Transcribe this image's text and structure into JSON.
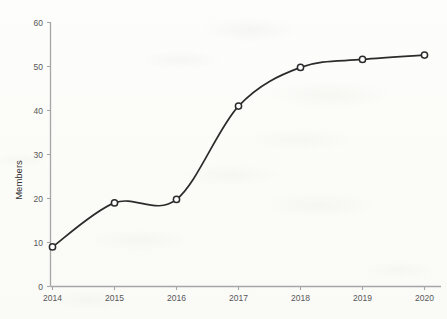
{
  "chart_data": {
    "type": "line",
    "title": "",
    "xlabel": "",
    "ylabel": "Members",
    "x": [
      2014,
      2015,
      2016,
      2017,
      2018,
      2019,
      2020
    ],
    "categories": [
      "2014",
      "2015",
      "2016",
      "2017",
      "2018",
      "2019",
      "2020"
    ],
    "values": [
      9,
      19,
      19.8,
      41,
      49.8,
      51.6,
      52.6
    ],
    "series": [
      {
        "name": "Members",
        "values": [
          9,
          19,
          19.8,
          41,
          49.8,
          51.6,
          52.6
        ]
      }
    ],
    "ylim": [
      0,
      60
    ],
    "yticks": [
      0,
      10,
      20,
      30,
      40,
      50,
      60
    ],
    "ytick_labels": [
      "0",
      "10",
      "20",
      "30",
      "40",
      "50",
      "60"
    ],
    "xlim": [
      2014,
      2020
    ],
    "xticks": [
      2014,
      2015,
      2016,
      2017,
      2018,
      2019,
      2020
    ],
    "xtick_labels": [
      "2014",
      "2015",
      "2016",
      "2017",
      "2018",
      "2019",
      "2020"
    ],
    "grid": false,
    "legend": false,
    "legend_position": "none",
    "smoothing": "spline",
    "marker": "open-circle",
    "colors": {
      "line": "#2b2b2b",
      "marker_fill": "#ffffff",
      "marker_stroke": "#2b2b2b",
      "axis": "#a6a6a6",
      "tick_label": "#575757",
      "axis_title": "#333333",
      "background": "#fdfdfb"
    }
  }
}
